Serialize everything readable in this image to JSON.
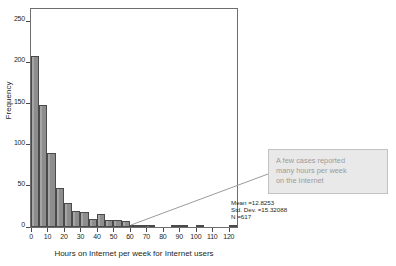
{
  "chart_data": {
    "type": "bar",
    "title": "",
    "xlabel": "Hours on Internet per week for Internet users",
    "ylabel": "Frequency",
    "xlim": [
      0,
      125
    ],
    "ylim": [
      0,
      265
    ],
    "grid": false,
    "bin_width": 5,
    "x_ticks": [
      "0",
      "10",
      "20",
      "30",
      "40",
      "50",
      "60",
      "70",
      "80",
      "90",
      "100",
      "110",
      "120"
    ],
    "x_tick_values": [
      0,
      10,
      20,
      30,
      40,
      50,
      60,
      70,
      80,
      90,
      100,
      110,
      120
    ],
    "y_ticks": [
      "0",
      "50",
      "100",
      "150",
      "200",
      "250"
    ],
    "y_tick_values": [
      0,
      50,
      100,
      150,
      200,
      250
    ],
    "bin_starts": [
      0,
      5,
      10,
      15,
      20,
      25,
      30,
      35,
      40,
      45,
      50,
      55,
      60,
      65,
      70,
      75,
      80,
      85,
      90,
      95,
      100,
      105,
      110,
      115,
      120
    ],
    "values": [
      208,
      148,
      90,
      47,
      29,
      20,
      18,
      10,
      16,
      8,
      9,
      7,
      2,
      2,
      3,
      0,
      0,
      1,
      2,
      0,
      1,
      0,
      0,
      0,
      1
    ],
    "bar_color": "#8d8d8d",
    "bar_edge_color": "#4a4a4a",
    "annotations": [
      {
        "text": "A few cases reported many hours per week on the Internet",
        "style": "callout-box",
        "box_color": "#e9e9e9",
        "text_color": "#9b9b9b"
      }
    ]
  },
  "statistics": {
    "mean": "Mean =12.8253",
    "std_dev": "Std. Dev. =15.32088",
    "n": "N =617"
  },
  "callout": {
    "line1": "A few cases reported",
    "line2": "many hours per week",
    "line3": "on the Internet"
  }
}
